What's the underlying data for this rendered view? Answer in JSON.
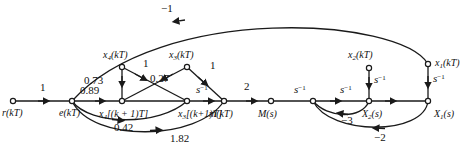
{
  "figure": {
    "type": "signal-flow-graph",
    "title": "",
    "background": "#ffffff",
    "stroke": "#1a1a1a",
    "node_fill": "#ffffff"
  },
  "nodes": [
    {
      "id": "r",
      "label": "r(kT)",
      "x": 13,
      "y": 101,
      "label_dx": -11,
      "label_dy": 12,
      "open": true
    },
    {
      "id": "e",
      "label": "e(kT)",
      "x": 72,
      "y": 101,
      "label_dx": -12,
      "label_dy": 12,
      "open": true
    },
    {
      "id": "x4n",
      "label": "x4[(k + 1)T]",
      "x": 122,
      "y": 101,
      "label_dx": -18,
      "label_dy": 13,
      "open": true
    },
    {
      "id": "x3n",
      "label": "x3[(k+1)T]",
      "x": 187,
      "y": 101,
      "label_dx": -6,
      "label_dy": 13,
      "open": true
    },
    {
      "id": "m",
      "label": "m(kT)",
      "x": 224,
      "y": 101,
      "label_dx": -13,
      "label_dy": 13,
      "open": true
    },
    {
      "id": "Ms",
      "label": "M(s)",
      "x": 271,
      "y": 101,
      "label_dx": -12,
      "label_dy": 13,
      "open": true
    },
    {
      "id": "j1",
      "label": "",
      "x": 313,
      "y": 101,
      "label_dx": 0,
      "label_dy": 0,
      "open": true
    },
    {
      "id": "X2s",
      "label": "X2(s)",
      "x": 369,
      "y": 101,
      "label_dx": -5,
      "label_dy": 13,
      "open": true
    },
    {
      "id": "X1s",
      "label": "X1(s)",
      "x": 428,
      "y": 101,
      "label_dx": 6,
      "label_dy": 13,
      "open": true
    },
    {
      "id": "x4k",
      "label": "x4(kT)",
      "x": 122,
      "y": 67,
      "label_dx": -16,
      "label_dy": -7,
      "open": true
    },
    {
      "id": "x3k",
      "label": "x3(kT)",
      "x": 187,
      "y": 67,
      "label_dx": -16,
      "label_dy": -7,
      "open": true
    },
    {
      "id": "x2k",
      "label": "x2(kT)",
      "x": 369,
      "y": 68,
      "label_dx": -18,
      "label_dy": -7,
      "open": true
    },
    {
      "id": "x1k",
      "label": "x1(kT)",
      "x": 428,
      "y": 64,
      "label_dx": 7,
      "label_dy": 4,
      "open": true
    }
  ],
  "edges": [
    {
      "from": "r",
      "to": "e",
      "gain": "1",
      "gain_x": 44,
      "gain_y": 86
    },
    {
      "from": "e",
      "to": "x4n",
      "gain": "0.89",
      "gain_x": 89,
      "gain_y": 89
    },
    {
      "from": "x4k",
      "to": "x4n",
      "gain": "0.73",
      "gain_x": 93,
      "gain_y": 80,
      "note": "vertical down"
    },
    {
      "from": "x4k",
      "to": "x3n",
      "gain": "1",
      "gain_x": 142,
      "gain_y": 62,
      "note": "diagonal crossing"
    },
    {
      "from": "x3k",
      "to": "x4n",
      "gain": "0.27",
      "gain_x": 155,
      "gain_y": 77,
      "note": "diagonal crossing"
    },
    {
      "from": "x3k",
      "to": "m",
      "gain": "1",
      "gain_x": 214,
      "gain_y": 67
    },
    {
      "from": "x3n",
      "to": "m",
      "gain": "s-1",
      "gain_x": 203,
      "gain_y": 88
    },
    {
      "from": "m",
      "to": "Ms",
      "gain": "2",
      "gain_x": 248,
      "gain_y": 85
    },
    {
      "from": "Ms",
      "to": "j1",
      "gain": "",
      "gain_x": 0,
      "gain_y": 0
    },
    {
      "from": "j1",
      "to": "X2s",
      "gain": "s-1",
      "gain_x": 300,
      "gain_y": 88
    },
    {
      "from": "X2s",
      "to": "X1s",
      "gain": "s-1",
      "gain_x": 345,
      "gain_y": 88
    },
    {
      "from": "x2k",
      "to": "X2s",
      "gain": "s-1",
      "gain_x": 375,
      "gain_y": 80,
      "note": "vertical down"
    },
    {
      "from": "x1k",
      "to": "X1s",
      "gain": "s-1",
      "gain_x": 434,
      "gain_y": 80,
      "note": "vertical down"
    },
    {
      "from": "e",
      "to": "x3n",
      "gain": "0.42",
      "gain_x": 126,
      "gain_y": 125,
      "note": "lower arc"
    },
    {
      "from": "e",
      "to": "m",
      "gain": "1.82",
      "gain_x": 183,
      "gain_y": 136,
      "note": "lower arc"
    },
    {
      "from": "X2s",
      "to": "j1",
      "gain": "-3",
      "gain_x": 349,
      "gain_y": 118,
      "note": "feedback arc"
    },
    {
      "from": "X1s",
      "to": "j1",
      "gain": "-2",
      "gain_x": 381,
      "gain_y": 135,
      "note": "feedback arc"
    },
    {
      "from": "x1k",
      "to": "e",
      "gain": "-1",
      "gain_x": 167,
      "gain_y": 5,
      "note": "long top feedback arc"
    }
  ],
  "gain_labels": {
    "g_one_re": "1",
    "g_089": "0.89",
    "g_073": "0.73",
    "g_one_x4x3": "1",
    "g_027": "0.27",
    "g_one_x3m": "1",
    "g_sinv_a": "s",
    "g_two": "2",
    "g_sinv_b": "s",
    "g_sinv_c": "s",
    "g_sinv_x2": "s",
    "g_sinv_x1": "s",
    "g_042": "0.42",
    "g_182": "1.82",
    "g_neg3": "−3",
    "g_neg2": "−2",
    "g_neg1": "−1",
    "exp": "−1"
  },
  "node_labels": {
    "r": "r",
    "e": "e",
    "m": "m",
    "M": "M",
    "X": "X",
    "x": "x",
    "kT": "(kT)",
    "s": "(s)",
    "x4next": "[(k + 1)T]",
    "x3next": "[(k+1)T]"
  }
}
